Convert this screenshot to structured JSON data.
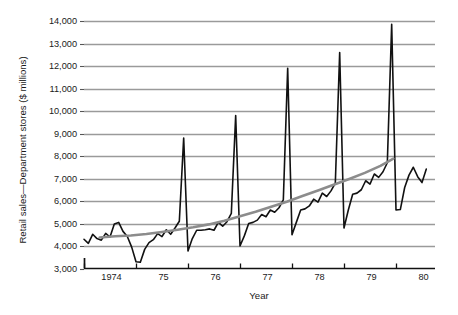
{
  "chart_data": {
    "type": "line",
    "title": "",
    "xlabel": "Year",
    "ylabel": "Retail sales—Department stores ($ millions)",
    "ylim": [
      3000,
      14000
    ],
    "xlim": [
      1974.0,
      1980.75
    ],
    "grid": true,
    "legend": "none",
    "ytick_labels": [
      "14,000",
      "13,000",
      "12,000",
      "11,000",
      "10,000",
      "9,000",
      "8,000",
      "7,000",
      "6,000",
      "5,000",
      "4,000",
      "3,000"
    ],
    "ytick_values": [
      14000,
      13000,
      12000,
      11000,
      10000,
      9000,
      8000,
      7000,
      6000,
      5000,
      4000,
      3000
    ],
    "xtick_labels": [
      "1974",
      "75",
      "76",
      "77",
      "78",
      "79",
      "80"
    ],
    "xtick_values": [
      1974,
      1975,
      1976,
      1977,
      1978,
      1979,
      1980
    ],
    "series": [
      {
        "name": "Retail sales — Department stores (monthly)",
        "color": "#111111",
        "style": "solid",
        "width": 1.6,
        "x": [
          1974.0,
          1974.083,
          1974.167,
          1974.25,
          1974.333,
          1974.417,
          1974.5,
          1974.583,
          1974.667,
          1974.75,
          1974.833,
          1974.917,
          1975.0,
          1975.083,
          1975.167,
          1975.25,
          1975.333,
          1975.417,
          1975.5,
          1975.583,
          1975.667,
          1975.75,
          1975.833,
          1975.917,
          1976.0,
          1976.083,
          1976.167,
          1976.25,
          1976.333,
          1976.417,
          1976.5,
          1976.583,
          1976.667,
          1976.75,
          1976.833,
          1976.917,
          1977.0,
          1977.083,
          1977.167,
          1977.25,
          1977.333,
          1977.417,
          1977.5,
          1977.583,
          1977.667,
          1977.75,
          1977.833,
          1977.917,
          1978.0,
          1978.083,
          1978.167,
          1978.25,
          1978.333,
          1978.417,
          1978.5,
          1978.583,
          1978.667,
          1978.75,
          1978.833,
          1978.917,
          1979.0,
          1979.083,
          1979.167,
          1979.25,
          1979.333,
          1979.417,
          1979.5,
          1979.583,
          1979.667,
          1979.75,
          1979.833,
          1979.917,
          1980.0,
          1980.083,
          1980.167,
          1980.25,
          1980.333,
          1980.417,
          1980.5,
          1980.583
        ],
        "y": [
          4300,
          4120,
          4520,
          4330,
          4260,
          4560,
          4400,
          4980,
          5050,
          4650,
          4420,
          3950,
          3300,
          3280,
          3850,
          4150,
          4280,
          4550,
          4420,
          4720,
          4520,
          4800,
          5100,
          8800,
          3780,
          4330,
          4700,
          4700,
          4720,
          4760,
          4700,
          5050,
          4880,
          5080,
          5450,
          9800,
          4000,
          4450,
          5000,
          5050,
          5150,
          5400,
          5300,
          5600,
          5500,
          5700,
          6050,
          11900,
          4500,
          5050,
          5600,
          5650,
          5780,
          6080,
          5950,
          6350,
          6200,
          6450,
          6800,
          12600,
          4800,
          5600,
          6300,
          6350,
          6500,
          6900,
          6750,
          7200,
          7050,
          7300,
          7700,
          13850,
          5600,
          5620,
          6600,
          7150,
          7500,
          7080,
          6820,
          7420
        ]
      },
      {
        "name": "Smoothed trend",
        "color": "#8c8c8c",
        "style": "solid",
        "width": 2.6,
        "x": [
          1974.3,
          1974.6,
          1974.9,
          1975.2,
          1975.5,
          1975.8,
          1976.1,
          1976.4,
          1976.7,
          1977.0,
          1977.3,
          1977.6,
          1977.9,
          1978.2,
          1978.5,
          1978.8,
          1979.1,
          1979.4,
          1979.7,
          1979.95
        ],
        "y": [
          4380,
          4430,
          4470,
          4530,
          4620,
          4720,
          4830,
          4960,
          5120,
          5320,
          5520,
          5740,
          5970,
          6220,
          6470,
          6720,
          6980,
          7250,
          7560,
          7880
        ]
      }
    ]
  }
}
